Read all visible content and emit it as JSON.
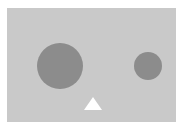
{
  "scene": {
    "background_color": "#ffffff",
    "panel": {
      "x": 7,
      "y": 8,
      "width": 169,
      "height": 114,
      "color": "#c9c9c9"
    },
    "shapes": [
      {
        "type": "circle",
        "name": "large-circle",
        "cx": 60,
        "cy": 66,
        "r": 23,
        "color": "#8c8c8c"
      },
      {
        "type": "circle",
        "name": "small-circle",
        "cx": 148,
        "cy": 66,
        "r": 14,
        "color": "#8c8c8c"
      },
      {
        "type": "triangle",
        "name": "triangle",
        "points": "93,97 84,110 102,110",
        "color": "#ffffff"
      }
    ]
  }
}
